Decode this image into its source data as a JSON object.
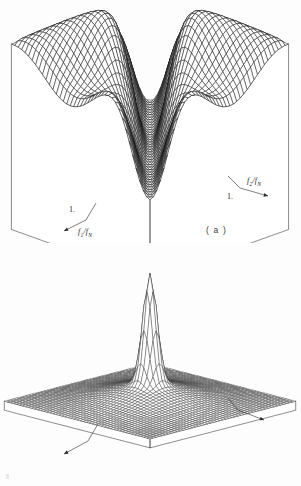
{
  "figure": {
    "background_color": "#fdfdfd",
    "ink_color": "#1a1a1a",
    "panels": [
      {
        "id": "a",
        "caption": "( a )",
        "axes": {
          "x_label_base": "f",
          "x_label_sub": "2",
          "x_label_tail": "/f",
          "x_label_tail_sub": "N",
          "x_label_text": "f2/fN",
          "y_label_text": "f1/fN",
          "y_label_base": "f",
          "y_label_sub": "1",
          "y_label_tail": "/f",
          "y_label_tail_sub": "N",
          "tick_right": "1.",
          "tick_left": "1."
        }
      },
      {
        "id": "b",
        "caption": "( b )",
        "axes": {
          "x_label_base": "f",
          "x_label_sub": "2",
          "x_label_tail": "/f",
          "x_label_tail_sub": "N",
          "x_label_text": "f2/fN",
          "y_label_text": "f1/fN",
          "y_label_base": "f",
          "y_label_sub": "1",
          "y_label_tail": "/f",
          "y_label_tail_sub": "N",
          "tick_right": "1.",
          "tick_left": "1."
        }
      }
    ]
  },
  "chart_data": [
    {
      "type": "surface",
      "panel": "a",
      "title": "",
      "xlabel": "f2/fN",
      "ylabel": "f1/fN",
      "zlabel": "",
      "xlim": [
        0,
        1
      ],
      "ylim": [
        0,
        1
      ],
      "grid": true,
      "legend": "none",
      "mesh_nx": 40,
      "mesh_ny": 40,
      "projection": {
        "azimuth_deg": 45,
        "elevation_deg": 28,
        "pedestal": true
      },
      "description": "Two-dimensional magnitude frequency response with a raised plateau at the outer corners, two rounded peaks along the far edge and a deep diagonal valley crossing the centre of the square frequency plane.",
      "surface_model": {
        "kind": "diagonal-valley-bandstop",
        "base_level": 0.52,
        "peak_level": 1.0,
        "valley_level": 0.05,
        "valley_axis": "f1 - f2 = 0",
        "valley_half_width": 0.085,
        "corner_ripple_amplitude": 0.12,
        "ripple_periods": 2.0
      },
      "z_ticks": [],
      "x_ticks": [
        {
          "value": 1.0,
          "label": "1."
        }
      ],
      "y_ticks": [
        {
          "value": 1.0,
          "label": "1."
        }
      ]
    },
    {
      "type": "surface",
      "panel": "b",
      "title": "",
      "xlabel": "f2/fN",
      "ylabel": "f1/fN",
      "zlabel": "",
      "xlim": [
        0,
        1
      ],
      "ylim": [
        0,
        1
      ],
      "grid": true,
      "legend": "none",
      "mesh_nx": 48,
      "mesh_ny": 48,
      "projection": {
        "azimuth_deg": 45,
        "elevation_deg": 22,
        "pedestal": true
      },
      "description": "Two-dimensional magnitude frequency response that is almost flat and near zero over the whole frequency plane except for a single very narrow, very tall impulse-like spike at the centre.",
      "surface_model": {
        "kind": "central-impulse",
        "base_level": 0.06,
        "peak_level": 1.0,
        "spike_center": [
          0.5,
          0.5
        ],
        "spike_half_width": 0.035,
        "shoulder_level": 0.1,
        "edge_rolloff": 0.04
      },
      "z_ticks": [],
      "x_ticks": [
        {
          "value": 1.0,
          "label": "1."
        }
      ],
      "y_ticks": [
        {
          "value": 1.0,
          "label": "1."
        }
      ]
    }
  ]
}
